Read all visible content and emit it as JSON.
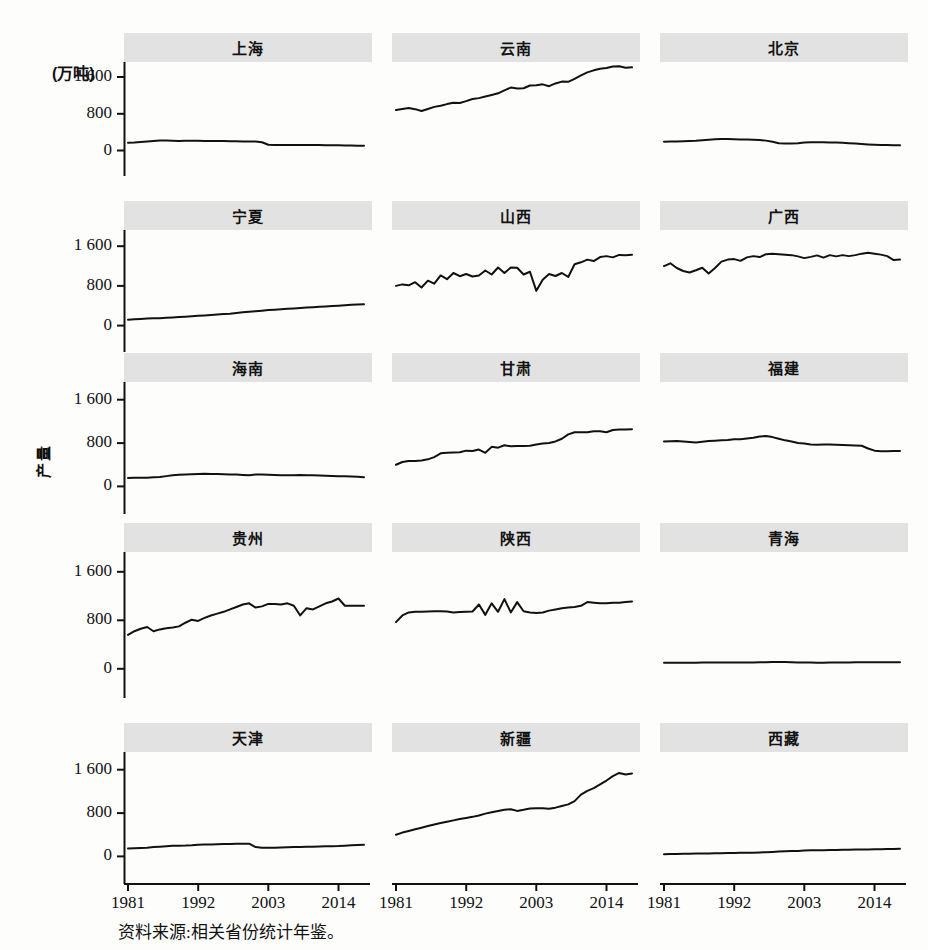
{
  "figure": {
    "unit_label": "(万吨)",
    "y_axis_title": "产量",
    "source_note": "资料来源:相关省份统计年鉴。",
    "line_color": "#111111",
    "strip_color": "#e2e2e2",
    "background_color": "#fdfdfc"
  },
  "chart_data": {
    "type": "line",
    "title": "",
    "subtitle": "",
    "xlabel": "",
    "ylabel": "产量",
    "unit": "万吨",
    "grid": false,
    "legend": "none",
    "layout": {
      "rows": 5,
      "cols": 3,
      "panel_titles_position": "top-strip"
    },
    "xlim": [
      1981,
      2018
    ],
    "ylim": [
      0,
      2100
    ],
    "xticks": [
      1981,
      1992,
      2003,
      2014
    ],
    "xtick_labels": [
      "1981",
      "1992",
      "2003",
      "2014"
    ],
    "yticks": [
      0,
      800,
      1600
    ],
    "ytick_labels": [
      "0",
      "800",
      "1 600"
    ],
    "x": [
      1981,
      1982,
      1983,
      1984,
      1985,
      1986,
      1987,
      1988,
      1989,
      1990,
      1991,
      1992,
      1993,
      1994,
      1995,
      1996,
      1997,
      1998,
      1999,
      2000,
      2001,
      2002,
      2003,
      2004,
      2005,
      2006,
      2007,
      2008,
      2009,
      2010,
      2011,
      2012,
      2013,
      2014,
      2015,
      2016,
      2017,
      2018
    ],
    "panels": [
      {
        "row": 1,
        "col": 1,
        "title": "上海",
        "values": [
          170,
          175,
          185,
          195,
          205,
          215,
          215,
          210,
          208,
          210,
          212,
          210,
          208,
          206,
          205,
          205,
          203,
          200,
          198,
          196,
          194,
          180,
          125,
          120,
          118,
          118,
          120,
          122,
          122,
          120,
          118,
          116,
          114,
          112,
          110,
          108,
          106,
          105
        ]
      },
      {
        "row": 1,
        "col": 2,
        "title": "云南",
        "values": [
          880,
          905,
          925,
          900,
          860,
          905,
          950,
          975,
          1010,
          1040,
          1035,
          1075,
          1120,
          1140,
          1175,
          1210,
          1245,
          1310,
          1370,
          1350,
          1355,
          1415,
          1420,
          1440,
          1400,
          1460,
          1500,
          1495,
          1560,
          1635,
          1700,
          1745,
          1780,
          1795,
          1830,
          1835,
          1800,
          1810
        ]
      },
      {
        "row": 1,
        "col": 3,
        "title": "北京",
        "values": [
          190,
          195,
          198,
          200,
          205,
          212,
          225,
          235,
          245,
          250,
          248,
          245,
          240,
          238,
          235,
          230,
          215,
          190,
          160,
          150,
          152,
          158,
          172,
          178,
          180,
          178,
          176,
          172,
          168,
          160,
          150,
          140,
          132,
          126,
          122,
          118,
          115,
          112
        ]
      },
      {
        "row": 2,
        "col": 1,
        "title": "宁夏",
        "values": [
          120,
          130,
          135,
          142,
          148,
          150,
          158,
          165,
          172,
          180,
          188,
          196,
          205,
          212,
          222,
          232,
          240,
          255,
          268,
          278,
          290,
          300,
          312,
          320,
          330,
          338,
          346,
          355,
          362,
          370,
          378,
          386,
          394,
          402,
          410,
          418,
          426,
          432
        ]
      },
      {
        "row": 2,
        "col": 2,
        "title": "山西",
        "values": [
          800,
          830,
          812,
          875,
          768,
          905,
          845,
          1010,
          935,
          1060,
          995,
          1040,
          990,
          1010,
          1110,
          1030,
          1170,
          1060,
          1170,
          1165,
          1030,
          1085,
          700,
          925,
          1040,
          1000,
          1060,
          980,
          1235,
          1275,
          1330,
          1300,
          1380,
          1400,
          1375,
          1425,
          1420,
          1430
        ]
      },
      {
        "row": 2,
        "col": 3,
        "title": "广西",
        "values": [
          1200,
          1255,
          1160,
          1100,
          1070,
          1115,
          1165,
          1050,
          1160,
          1290,
          1330,
          1340,
          1305,
          1375,
          1400,
          1380,
          1440,
          1450,
          1440,
          1430,
          1420,
          1395,
          1360,
          1385,
          1415,
          1370,
          1420,
          1395,
          1420,
          1400,
          1420,
          1450,
          1470,
          1450,
          1430,
          1400,
          1320,
          1330
        ]
      },
      {
        "row": 3,
        "col": 1,
        "title": "海南",
        "values": [
          155,
          158,
          160,
          162,
          168,
          175,
          190,
          205,
          215,
          220,
          224,
          230,
          232,
          230,
          228,
          226,
          222,
          218,
          212,
          208,
          218,
          220,
          216,
          210,
          206,
          205,
          208,
          210,
          208,
          206,
          202,
          198,
          194,
          190,
          186,
          182,
          178,
          170
        ]
      },
      {
        "row": 3,
        "col": 2,
        "title": "甘肃",
        "values": [
          400,
          450,
          470,
          470,
          480,
          500,
          540,
          610,
          620,
          625,
          630,
          660,
          655,
          680,
          620,
          730,
          715,
          760,
          740,
          745,
          745,
          750,
          775,
          790,
          800,
          830,
          880,
          960,
          1000,
          1000,
          1000,
          1020,
          1020,
          1000,
          1040,
          1050,
          1050,
          1055
        ]
      },
      {
        "row": 3,
        "col": 3,
        "title": "福建",
        "values": [
          830,
          835,
          840,
          830,
          820,
          810,
          825,
          840,
          845,
          850,
          855,
          870,
          870,
          885,
          900,
          920,
          930,
          910,
          880,
          850,
          830,
          800,
          790,
          775,
          770,
          775,
          775,
          770,
          765,
          760,
          755,
          750,
          700,
          660,
          650,
          650,
          655,
          655
        ]
      },
      {
        "row": 4,
        "col": 1,
        "title": "贵州",
        "values": [
          560,
          620,
          660,
          690,
          620,
          650,
          670,
          680,
          700,
          760,
          810,
          790,
          840,
          880,
          910,
          940,
          980,
          1020,
          1060,
          1080,
          1010,
          1030,
          1070,
          1070,
          1060,
          1080,
          1040,
          880,
          1000,
          980,
          1030,
          1080,
          1110,
          1160,
          1040,
          1040,
          1040,
          1040
        ]
      },
      {
        "row": 4,
        "col": 2,
        "title": "陕西",
        "values": [
          770,
          880,
          930,
          940,
          940,
          945,
          950,
          950,
          945,
          930,
          935,
          940,
          945,
          1060,
          890,
          1080,
          940,
          1150,
          930,
          1100,
          950,
          930,
          920,
          930,
          960,
          980,
          1000,
          1010,
          1020,
          1040,
          1100,
          1090,
          1080,
          1080,
          1090,
          1090,
          1100,
          1110
        ]
      },
      {
        "row": 4,
        "col": 3,
        "title": "青海",
        "values": [
          100,
          100,
          100,
          102,
          102,
          102,
          103,
          104,
          104,
          104,
          105,
          105,
          106,
          106,
          106,
          107,
          108,
          112,
          112,
          112,
          108,
          105,
          104,
          103,
          102,
          102,
          103,
          105,
          106,
          106,
          107,
          108,
          108,
          108,
          108,
          108,
          108,
          108
        ]
      },
      {
        "row": 5,
        "col": 1,
        "title": "天津",
        "values": [
          145,
          150,
          155,
          162,
          172,
          180,
          190,
          195,
          198,
          200,
          205,
          215,
          220,
          222,
          225,
          228,
          230,
          232,
          235,
          235,
          172,
          162,
          158,
          160,
          165,
          170,
          172,
          175,
          178,
          180,
          182,
          186,
          190,
          192,
          198,
          205,
          212,
          216
        ]
      },
      {
        "row": 5,
        "col": 2,
        "title": "新疆",
        "values": [
          400,
          440,
          470,
          500,
          530,
          560,
          590,
          615,
          640,
          665,
          690,
          710,
          730,
          755,
          790,
          815,
          840,
          860,
          870,
          840,
          860,
          885,
          890,
          890,
          880,
          900,
          930,
          960,
          1020,
          1140,
          1210,
          1260,
          1330,
          1400,
          1480,
          1540,
          1510,
          1530
        ]
      },
      {
        "row": 5,
        "col": 3,
        "title": "西藏",
        "values": [
          42,
          44,
          46,
          48,
          50,
          52,
          54,
          56,
          58,
          60,
          62,
          64,
          66,
          68,
          70,
          74,
          78,
          84,
          90,
          94,
          98,
          102,
          108,
          112,
          114,
          116,
          118,
          120,
          122,
          124,
          126,
          128,
          130,
          132,
          134,
          136,
          138,
          140
        ]
      }
    ]
  }
}
